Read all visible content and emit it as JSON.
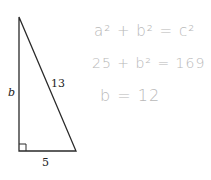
{
  "triangle": {
    "side_vertical_label": "b",
    "hypotenuse_label": "13",
    "base_label": "5",
    "stroke_color": "#2a2a2a"
  },
  "handwriting": {
    "line1": "a² + b² = c²",
    "line2": "25 + b² = 169",
    "line3": "b = 12",
    "color": "#b8b8b8"
  }
}
